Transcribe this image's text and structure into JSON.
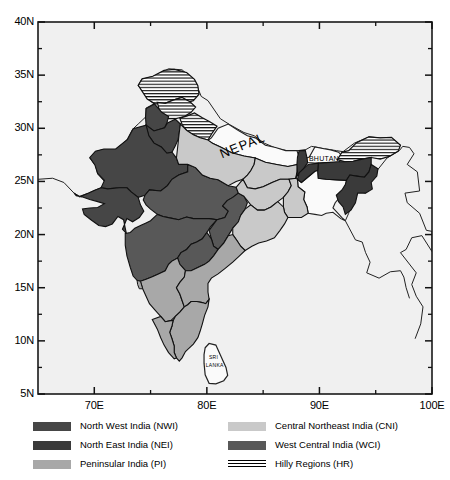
{
  "figure": {
    "type": "map",
    "projection": "equirectangular",
    "background_color": "#f0f0f0",
    "frame_color": "#000000"
  },
  "axes": {
    "x": {
      "label": "",
      "min": 65,
      "max": 100,
      "major_ticks": [
        70,
        80,
        90,
        100
      ],
      "major_tick_labels": [
        "70E",
        "80E",
        "90E",
        "100E"
      ],
      "minor_ticks": [
        65,
        75,
        85,
        95
      ]
    },
    "y": {
      "label": "",
      "min": 5,
      "max": 40,
      "major_ticks": [
        5,
        10,
        15,
        20,
        25,
        30,
        35,
        40
      ],
      "major_tick_labels": [
        "5N",
        "10N",
        "15N",
        "20N",
        "25N",
        "30N",
        "35N",
        "40N"
      ],
      "minor_ticks": [
        7.5,
        12.5,
        17.5,
        22.5,
        27.5,
        32.5,
        37.5
      ]
    }
  },
  "map_labels": [
    {
      "name": "NEPAL",
      "text": "NEPAL",
      "lon": 83.2,
      "lat": 28.3,
      "rotation": -22,
      "size": 13
    },
    {
      "name": "BHUTAN",
      "text": "BHUTAN",
      "lon": 90.4,
      "lat": 27.1,
      "rotation": 0,
      "size": 7
    },
    {
      "name": "SRILANKA",
      "text": "SRI",
      "lon": 80.6,
      "lat": 8.4,
      "rotation": 0,
      "size": 5
    },
    {
      "name": "SRILANKA2",
      "text": "LANKA",
      "lon": 80.7,
      "lat": 7.7,
      "rotation": 0,
      "size": 5
    }
  ],
  "regions": {
    "NWI": {
      "label": "North West India (NWI)",
      "color": "#464646"
    },
    "NEI": {
      "label": "North East India (NEI)",
      "color": "#3a3a3a"
    },
    "PI": {
      "label": "Peninsular India (PI)",
      "color": "#a8a8a8"
    },
    "CNI": {
      "label": "Central Northeast India (CNI)",
      "color": "#c9c9c9"
    },
    "WCI": {
      "label": "West Central India (WCI)",
      "color": "#585858"
    },
    "HR": {
      "label": "Hilly Regions (HR)",
      "color": "hatch"
    }
  },
  "legend": {
    "columns": [
      {
        "items": [
          {
            "key": "NWI",
            "label": "North West India (NWI)",
            "swatch": "#464646"
          },
          {
            "key": "NEI",
            "label": "North East India (NEI)",
            "swatch": "#3a3a3a"
          },
          {
            "key": "PI",
            "label": "Peninsular India (PI)",
            "swatch": "#a8a8a8"
          }
        ]
      },
      {
        "items": [
          {
            "key": "CNI",
            "label": "Central Northeast India (CNI)",
            "swatch": "#c9c9c9"
          },
          {
            "key": "WCI",
            "label": "West Central India (WCI)",
            "swatch": "#585858"
          },
          {
            "key": "HR",
            "label": "Hilly Regions (HR)",
            "swatch": "hatch"
          }
        ]
      }
    ]
  }
}
